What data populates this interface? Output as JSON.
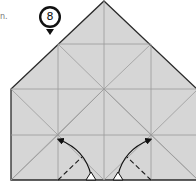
{
  "diagram": {
    "step_number": "8",
    "caption_fragment": "n.",
    "colors": {
      "paper_fill": "#d6d6d6",
      "outline": "#2a2a2a",
      "crease": "#9a9a9a",
      "marker_fill": "#111111",
      "arrow": "#111111"
    },
    "elements": [
      {
        "type": "paper",
        "shape": "house-pentagon",
        "description": "Square with triangular top"
      },
      {
        "type": "crease-grid",
        "description": "Vertical and horizontal creases with diagonals"
      },
      {
        "type": "valley-fold-line",
        "side": "left"
      },
      {
        "type": "valley-fold-line",
        "side": "right"
      },
      {
        "type": "fold-arrow",
        "side": "left"
      },
      {
        "type": "fold-arrow",
        "side": "right"
      }
    ]
  }
}
